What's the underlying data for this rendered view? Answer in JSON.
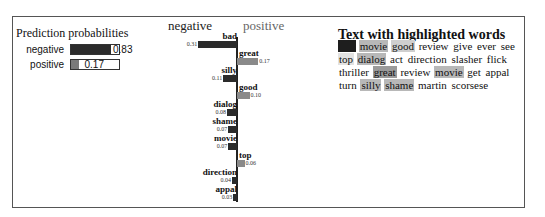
{
  "prediction_probabilities": {
    "title": "Prediction probabilities",
    "rows": [
      {
        "label": "negative",
        "value": 0.83,
        "value_text": "0.83",
        "color": "#2b2b2b"
      },
      {
        "label": "positive",
        "value": 0.17,
        "value_text": "0.17",
        "color": "#7a7a7a"
      }
    ]
  },
  "chart_data": {
    "type": "bar",
    "orientation": "horizontal-diverging",
    "legend": {
      "negative": "negative",
      "positive": "positive"
    },
    "categories": [
      "bad",
      "great",
      "silly",
      "good",
      "dialog",
      "shame",
      "movie",
      "top",
      "direction",
      "appal"
    ],
    "values": [
      -0.31,
      0.17,
      -0.11,
      0.1,
      -0.08,
      -0.07,
      -0.07,
      0.06,
      -0.04,
      -0.03
    ],
    "value_labels": [
      "0.31",
      "0.17",
      "0.11",
      "0.10",
      "0.08",
      "0.07",
      "0.07",
      "0.06",
      "0.04",
      "0.03"
    ],
    "colors": {
      "negative": "#2b2b2b",
      "positive": "#8a8a8a"
    }
  },
  "text_highlight": {
    "title": "Text with highlighted words",
    "words": [
      {
        "w": "bad",
        "hl": "neg-strong"
      },
      {
        "w": "movie",
        "hl": "neg-light"
      },
      {
        "w": "good",
        "hl": "pos-light"
      },
      {
        "w": "review",
        "hl": ""
      },
      {
        "w": "give",
        "hl": ""
      },
      {
        "w": "ever",
        "hl": ""
      },
      {
        "w": "see",
        "hl": ""
      },
      {
        "w": "top",
        "hl": "pos-faint"
      },
      {
        "w": "dialog",
        "hl": "neg-light"
      },
      {
        "w": "act",
        "hl": ""
      },
      {
        "w": "direction",
        "hl": ""
      },
      {
        "w": "slasher",
        "hl": ""
      },
      {
        "w": "flick",
        "hl": ""
      },
      {
        "w": "thriller",
        "hl": ""
      },
      {
        "w": "great",
        "hl": "pos-mid"
      },
      {
        "w": "review",
        "hl": ""
      },
      {
        "w": "movie",
        "hl": "neg-light"
      },
      {
        "w": "get",
        "hl": ""
      },
      {
        "w": "appal",
        "hl": ""
      },
      {
        "w": "turn",
        "hl": ""
      },
      {
        "w": "silly",
        "hl": "neg-light"
      },
      {
        "w": "shame",
        "hl": "neg-light"
      },
      {
        "w": "martin",
        "hl": ""
      },
      {
        "w": "scorsese",
        "hl": ""
      }
    ],
    "highlight_colors": {
      "neg-strong": "#1e1e1e",
      "neg-light": "#b8b8b8",
      "pos-light": "#cfcfcf",
      "pos-mid": "#9a9a9a",
      "pos-faint": "#e2e2e2"
    }
  }
}
